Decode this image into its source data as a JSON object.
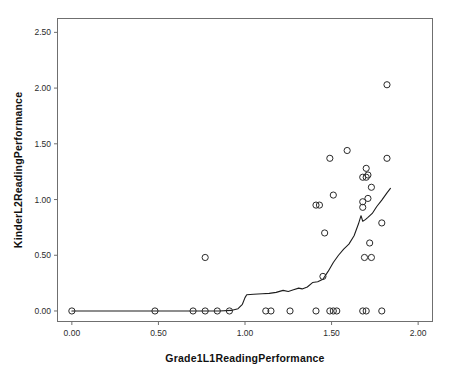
{
  "chart_data": {
    "type": "scatter",
    "title": "",
    "subtitle": "",
    "xlabel": "Grade1L1ReadingPerformance",
    "ylabel": "KinderL2ReadingPerformance",
    "xlim": [
      -0.08,
      2.08
    ],
    "ylim": [
      -0.09,
      2.62
    ],
    "xticks": [
      0.0,
      0.5,
      1.0,
      1.5,
      2.0
    ],
    "xticklabels": [
      "0.00",
      "0.50",
      "1.00",
      "1.50",
      "2.00"
    ],
    "yticks": [
      0.0,
      0.5,
      1.0,
      1.5,
      2.0,
      2.5
    ],
    "yticklabels": [
      "0.00",
      "0.50",
      "1.00",
      "1.50",
      "2.00",
      "2.50"
    ],
    "grid": false,
    "legend": null,
    "marker": "open-circle",
    "marker_color": "#2a2a2a",
    "frame_color": "#6f6f6f",
    "background": "#ffffff",
    "series": [
      {
        "name": "observations",
        "points": [
          [
            0.0,
            0.0
          ],
          [
            0.48,
            0.0
          ],
          [
            0.7,
            0.0
          ],
          [
            0.77,
            0.0
          ],
          [
            0.84,
            0.0
          ],
          [
            0.91,
            0.0
          ],
          [
            1.12,
            0.0
          ],
          [
            1.15,
            0.0
          ],
          [
            1.26,
            0.0
          ],
          [
            1.41,
            0.0
          ],
          [
            1.49,
            0.0
          ],
          [
            1.51,
            0.0
          ],
          [
            1.53,
            0.0
          ],
          [
            1.68,
            0.0
          ],
          [
            1.7,
            0.0
          ],
          [
            1.79,
            0.0
          ],
          [
            0.77,
            0.48
          ],
          [
            1.45,
            0.31
          ],
          [
            1.69,
            0.48
          ],
          [
            1.73,
            0.48
          ],
          [
            1.72,
            0.61
          ],
          [
            1.79,
            0.79
          ],
          [
            1.46,
            0.7
          ],
          [
            1.41,
            0.95
          ],
          [
            1.43,
            0.95
          ],
          [
            1.68,
            0.93
          ],
          [
            1.68,
            0.98
          ],
          [
            1.71,
            1.01
          ],
          [
            1.51,
            1.04
          ],
          [
            1.73,
            1.11
          ],
          [
            1.68,
            1.2
          ],
          [
            1.7,
            1.2
          ],
          [
            1.71,
            1.22
          ],
          [
            1.7,
            1.28
          ],
          [
            1.49,
            1.37
          ],
          [
            1.82,
            1.37
          ],
          [
            1.59,
            1.44
          ],
          [
            1.82,
            2.03
          ]
        ]
      }
    ],
    "fit_line": {
      "name": "loess-fit",
      "points": [
        [
          0.0,
          0.0
        ],
        [
          0.2,
          0.0
        ],
        [
          0.4,
          0.0
        ],
        [
          0.6,
          0.0
        ],
        [
          0.75,
          0.0
        ],
        [
          0.85,
          0.0
        ],
        [
          0.92,
          0.005
        ],
        [
          0.96,
          0.02
        ],
        [
          0.985,
          0.06
        ],
        [
          1.0,
          0.12
        ],
        [
          1.01,
          0.145
        ],
        [
          1.05,
          0.15
        ],
        [
          1.1,
          0.155
        ],
        [
          1.14,
          0.158
        ],
        [
          1.18,
          0.167
        ],
        [
          1.22,
          0.185
        ],
        [
          1.25,
          0.175
        ],
        [
          1.28,
          0.19
        ],
        [
          1.31,
          0.205
        ],
        [
          1.33,
          0.198
        ],
        [
          1.36,
          0.215
        ],
        [
          1.39,
          0.255
        ],
        [
          1.42,
          0.262
        ],
        [
          1.45,
          0.285
        ],
        [
          1.48,
          0.355
        ],
        [
          1.51,
          0.435
        ],
        [
          1.54,
          0.5
        ],
        [
          1.57,
          0.555
        ],
        [
          1.6,
          0.6
        ],
        [
          1.63,
          0.675
        ],
        [
          1.655,
          0.78
        ],
        [
          1.67,
          0.855
        ],
        [
          1.68,
          0.805
        ],
        [
          1.695,
          0.82
        ],
        [
          1.71,
          0.84
        ],
        [
          1.735,
          0.875
        ],
        [
          1.76,
          0.935
        ],
        [
          1.79,
          0.995
        ],
        [
          1.82,
          1.06
        ],
        [
          1.84,
          1.1
        ]
      ]
    }
  }
}
